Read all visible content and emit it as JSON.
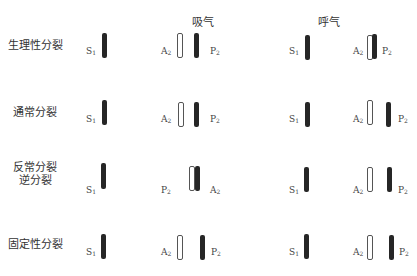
{
  "headers": {
    "inspiration": "吸气",
    "expiration": "呼气"
  },
  "sound_labels": {
    "S1": "S",
    "A2": "A",
    "P2": "P",
    "S1_sub": "1",
    "A2_sub": "2",
    "P2_sub": "2"
  },
  "rows": [
    {
      "label": "生理性分裂",
      "label_line2": ""
    },
    {
      "label": "通常分裂",
      "label_line2": ""
    },
    {
      "label": "反常分裂",
      "label_line2": "逆分裂"
    },
    {
      "label": "固定性分裂",
      "label_line2": ""
    }
  ],
  "legend": {
    "solid_bar": "filled component",
    "open_bar": "outlined component"
  }
}
